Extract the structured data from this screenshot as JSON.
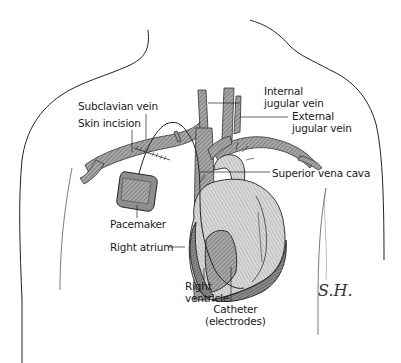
{
  "figure": {
    "labels": {
      "subclavian_vein": "Subclavian vein",
      "skin_incision": "Skin incision",
      "internal_jugular_vein": [
        "Internal",
        "jugular vein"
      ],
      "external_jugular_vein": [
        "External",
        "jugular vein"
      ],
      "superior_vena_cava": "Superior vena cava",
      "pacemaker": "Pacemaker",
      "right_atrium": "Right atrium",
      "right_ventricle": [
        "Right",
        "ventricle"
      ],
      "catheter": [
        "Catheter",
        "(electrodes)"
      ]
    },
    "signature": "S.H.",
    "colors": {
      "outline": "#222222",
      "vessel_fill": "#9a9a9a",
      "vessel_hatch": "#555555",
      "heart_fill": "#bdbdbd",
      "heart_light": "#e6e6e6",
      "pacemaker_fill": "#8d8d8d",
      "background": "#ffffff"
    }
  }
}
